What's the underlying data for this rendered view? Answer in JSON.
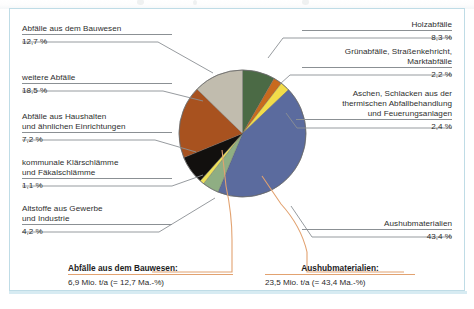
{
  "figure": {
    "frame_color": "#bfdce6",
    "background": "#ffffff"
  },
  "labels": {
    "bauwesen": {
      "line1": "Abfälle aus dem Bauwesen",
      "line2": "",
      "pct": "12,7 %"
    },
    "weitere": {
      "line1": "weitere Abfälle",
      "line2": "",
      "pct": "18,5 %"
    },
    "haushalte": {
      "line1": "Abfälle aus Haushalten",
      "line2": "und ähnlichen Einrichtungen",
      "pct": "7,2 %"
    },
    "klaerschlamm": {
      "line1": "kommunale Klärschlämme",
      "line2": "und Fäkalschlämme",
      "pct": "1,1 %"
    },
    "altstoffe": {
      "line1": "Altstoffe aus Gewerbe",
      "line2": "und Industrie",
      "pct": "4,2 %"
    },
    "holz": {
      "line1": "Holzabfälle",
      "line2": "",
      "pct": "8,3 %"
    },
    "gruen": {
      "line1": "Grünabfälle, Straßenkehricht,",
      "line2": "Marktabfälle",
      "pct": "2,2 %"
    },
    "aschen": {
      "line1": "Aschen, Schlacken aus der",
      "line2": "thermischen Abfallbehandlung",
      "line3": "und Feuerungsanlagen",
      "pct": "2,4 %"
    },
    "aushub": {
      "line1": "Aushubmaterialien",
      "line2": "",
      "pct": "43,4 %"
    }
  },
  "callouts": {
    "bauwesen": {
      "head": "Abfälle aus dem Bauwesen:",
      "sub": "6,9 Mio. t/a (= 12,7 Ma.-%)"
    },
    "aushub": {
      "head": "Aushubmaterialien:",
      "sub": "23,5 Mio. t/a (= 43,4 Ma.-%)"
    }
  },
  "chart_data": {
    "type": "pie",
    "title": "",
    "unit": "Ma.-%",
    "total_label": "",
    "legend_position": "callout-labels-around-pie",
    "start_angle_deg": 0,
    "direction": "clockwise",
    "categories": [
      "Holzabfälle",
      "Grünabfälle, Straßenkehricht, Marktabfälle",
      "Aschen, Schlacken aus der thermischen Abfallbehandlung und Feuerungsanlagen",
      "Aushubmaterialien",
      "Altstoffe aus Gewerbe und Industrie",
      "kommunale Klärschlämme und Fäkalschlämme",
      "Abfälle aus Haushalten und ähnlichen Einrichtungen",
      "weitere Abfälle",
      "Abfälle aus dem Bauwesen"
    ],
    "values": [
      8.3,
      2.2,
      2.4,
      43.4,
      4.2,
      1.1,
      7.2,
      18.5,
      12.7
    ],
    "value_labels": [
      "8,3 %",
      "2,2 %",
      "2,4 %",
      "43,4 %",
      "4,2 %",
      "1,1 %",
      "7,2 %",
      "18,5 %",
      "12,7 %"
    ],
    "colors": [
      "#4b6a45",
      "#c86a1e",
      "#f2dc4a",
      "#5b6b9e",
      "#8fae83",
      "#eee15a",
      "#12100e",
      "#a8521f",
      "#c1bcae"
    ],
    "annotations": [
      {
        "text": "Abfälle aus dem Bauwesen: 6,9 Mio. t/a (= 12,7 Ma.-%)",
        "target": "Abfälle aus dem Bauwesen"
      },
      {
        "text": "Aushubmaterialien: 23,5 Mio. t/a (= 43,4 Ma.-%)",
        "target": "Aushubmaterialien"
      }
    ]
  }
}
